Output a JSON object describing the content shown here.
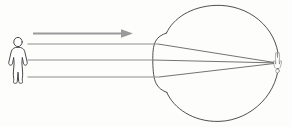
{
  "diagram": {
    "title": "Human eye optics: distant object imaged inverted on the retina",
    "type": "optical-ray-diagram",
    "background_color": "#fdfdfc",
    "ink_color": "#3b3b3b",
    "ray_color": "#5a5a5a",
    "arrow_color": "#9a9a9a",
    "canvas": {
      "width": 292,
      "height": 127
    }
  },
  "object": {
    "name": "standing human figure",
    "label": "",
    "position": {
      "x": 18,
      "y": 60
    },
    "height_px": 44,
    "orientation": "upright"
  },
  "light_direction_arrow": {
    "name": "light propagation arrow",
    "label": "",
    "direction": "right",
    "from": {
      "x": 33,
      "y": 33
    },
    "to": {
      "x": 130,
      "y": 33
    },
    "color": "#9a9a9a"
  },
  "eye": {
    "name": "eyeball",
    "label": "",
    "center": {
      "x": 218,
      "y": 62
    },
    "radius": 58,
    "cornea": {
      "name": "cornea",
      "label": "",
      "apex": {
        "x": 153,
        "y": 62
      },
      "top_notch": {
        "x": 166,
        "y": 33
      },
      "bottom_notch": {
        "x": 166,
        "y": 91
      }
    },
    "retina_focus_point": {
      "x": 275,
      "y": 63
    }
  },
  "rays": [
    {
      "name": "ray-from-head",
      "label": "",
      "start": {
        "x": 27,
        "y": 44
      },
      "cornea_hit": {
        "x": 159,
        "y": 44
      },
      "focus": {
        "x": 275,
        "y": 63
      }
    },
    {
      "name": "ray-from-center",
      "label": "",
      "start": {
        "x": 27,
        "y": 60
      },
      "cornea_hit": {
        "x": 153,
        "y": 60
      },
      "focus": {
        "x": 275,
        "y": 63
      }
    },
    {
      "name": "ray-from-feet",
      "label": "",
      "start": {
        "x": 27,
        "y": 77
      },
      "cornea_hit": {
        "x": 160,
        "y": 77
      },
      "focus": {
        "x": 275,
        "y": 63
      }
    }
  ],
  "retinal_image": {
    "name": "inverted retinal image of figure",
    "label": "",
    "position": {
      "x": 277,
      "y": 63
    },
    "orientation": "inverted",
    "height_px": 20
  },
  "labels": [],
  "annotations": []
}
